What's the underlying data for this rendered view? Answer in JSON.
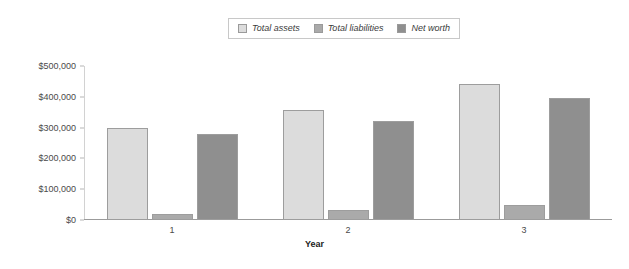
{
  "legend": {
    "position": "top-center",
    "items": [
      {
        "label": "Total assets",
        "color": "#dcdcdc"
      },
      {
        "label": "Total liabilities",
        "color": "#aaaaaa"
      },
      {
        "label": "Net worth",
        "color": "#8f8f8f"
      }
    ]
  },
  "chart_data": {
    "type": "bar",
    "title": "",
    "subtitle": "",
    "xlabel": "Year",
    "ylabel": "",
    "categories": [
      "1",
      "2",
      "3"
    ],
    "series": [
      {
        "name": "Total assets",
        "color": "#dcdcdc",
        "values": [
          300000,
          357000,
          443000
        ]
      },
      {
        "name": "Total liabilities",
        "color": "#aaaaaa",
        "values": [
          20000,
          33000,
          48000
        ]
      },
      {
        "name": "Net worth",
        "color": "#8f8f8f",
        "values": [
          280000,
          322000,
          395000
        ]
      }
    ],
    "ylim": [
      0,
      500000
    ],
    "yticks": [
      0,
      100000,
      200000,
      300000,
      400000,
      500000
    ],
    "ytick_labels": [
      "$0",
      "$100,000",
      "$200,000",
      "$300,000",
      "$400,000",
      "$500,000"
    ],
    "grid": false,
    "legend_position": "top-center"
  }
}
